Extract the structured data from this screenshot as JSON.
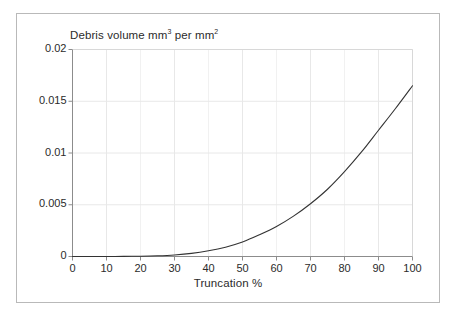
{
  "figure": {
    "frame_color": "#b9b9b9",
    "background": "#ffffff"
  },
  "chart_data": {
    "type": "line",
    "title": "Debris volume mm",
    "title_sup1": "3",
    "title_mid": " per mm",
    "title_sup2": "2",
    "title_full": "Debris volume mm3 per mm2",
    "xlabel": "Truncation %",
    "ylabel": "",
    "xlim": [
      0,
      100
    ],
    "ylim": [
      0,
      0.02
    ],
    "grid": true,
    "legend": "none",
    "line_color": "#333333",
    "grid_color": "#e8e8e8",
    "axis_color": "#8c8c8c",
    "xticks": [
      0,
      10,
      20,
      30,
      40,
      50,
      60,
      70,
      80,
      90,
      100
    ],
    "xtick_labels": [
      "0",
      "10",
      "20",
      "30",
      "40",
      "50",
      "60",
      "70",
      "80",
      "90",
      "100"
    ],
    "yticks": [
      0,
      0.005,
      0.01,
      0.015,
      0.02
    ],
    "ytick_labels": [
      "0",
      "0.005",
      "0.01",
      "0.015",
      "0.02"
    ],
    "x": [
      0,
      5,
      10,
      15,
      20,
      25,
      30,
      35,
      40,
      45,
      50,
      55,
      60,
      65,
      70,
      75,
      80,
      85,
      90,
      95,
      100
    ],
    "values": [
      0.0,
      0.0,
      0.0,
      1e-05,
      3e-05,
      7e-05,
      0.00015,
      0.0003,
      0.00055,
      0.0009,
      0.0014,
      0.0021,
      0.0029,
      0.0039,
      0.0051,
      0.0065,
      0.0082,
      0.0101,
      0.0122,
      0.0143,
      0.0165
    ],
    "series": [
      {
        "name": "Debris volume",
        "values": [
          0.0,
          0.0,
          0.0,
          1e-05,
          3e-05,
          7e-05,
          0.00015,
          0.0003,
          0.00055,
          0.0009,
          0.0014,
          0.0021,
          0.0029,
          0.0039,
          0.0051,
          0.0065,
          0.0082,
          0.0101,
          0.0122,
          0.0143,
          0.0165
        ]
      }
    ]
  }
}
